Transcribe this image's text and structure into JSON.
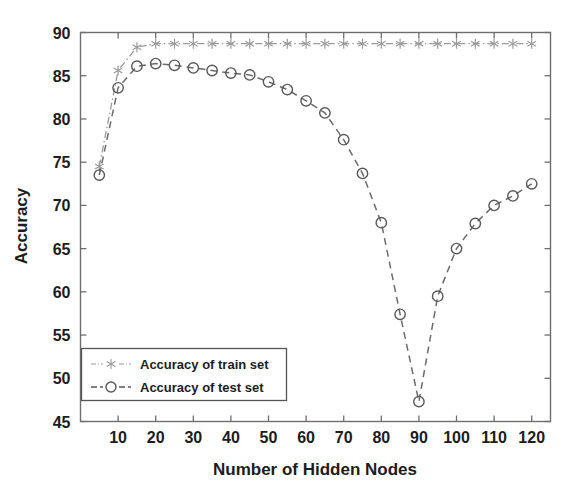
{
  "figure": {
    "background_color": "#ffffff",
    "axis_color": "#6e6e6e",
    "text_color": "#1c1c1c"
  },
  "chart_data": {
    "type": "line",
    "title": "",
    "xlabel": "Number of Hidden Nodes",
    "ylabel": "Accuracy",
    "xlim": [
      0,
      125
    ],
    "ylim": [
      45,
      90
    ],
    "xticks": [
      10,
      20,
      30,
      40,
      50,
      60,
      70,
      80,
      90,
      100,
      110,
      120
    ],
    "xtick_labels": [
      "10",
      "20",
      "30",
      "40",
      "50",
      "60",
      "70",
      "80",
      "90",
      "100",
      "110",
      "120"
    ],
    "yticks": [
      45,
      50,
      55,
      60,
      65,
      70,
      75,
      80,
      85,
      90
    ],
    "ytick_labels": [
      "45",
      "50",
      "55",
      "60",
      "65",
      "70",
      "75",
      "80",
      "85",
      "90"
    ],
    "grid": false,
    "legend_position": "lower left",
    "x": [
      5,
      10,
      15,
      20,
      25,
      30,
      35,
      40,
      45,
      50,
      55,
      60,
      65,
      70,
      75,
      80,
      85,
      90,
      95,
      100,
      105,
      110,
      115,
      120
    ],
    "series": [
      {
        "name": "Accuracy of train set",
        "marker": "asterisk",
        "linestyle": "dashdot",
        "color": "#9a9a9a",
        "values": [
          74.5,
          85.6,
          88.3,
          88.7,
          88.7,
          88.7,
          88.7,
          88.7,
          88.7,
          88.7,
          88.7,
          88.7,
          88.7,
          88.7,
          88.7,
          88.7,
          88.7,
          88.7,
          88.7,
          88.7,
          88.7,
          88.7,
          88.7,
          88.7
        ]
      },
      {
        "name": "Accuracy of test set",
        "marker": "circle",
        "linestyle": "dashed",
        "color": "#585858",
        "values": [
          73.5,
          83.6,
          86.1,
          86.4,
          86.2,
          85.9,
          85.6,
          85.3,
          85.1,
          84.3,
          83.4,
          82.1,
          80.7,
          77.6,
          73.7,
          68.0,
          57.4,
          47.3,
          59.5,
          65.0,
          67.9,
          70.0,
          71.1,
          72.5
        ]
      }
    ]
  },
  "legend": {
    "entries": [
      {
        "label": "Accuracy of train set",
        "marker": "asterisk-marker",
        "linestyle": "dashdot"
      },
      {
        "label": "Accuracy of test set",
        "marker": "circle-marker",
        "linestyle": "dashed"
      }
    ]
  }
}
